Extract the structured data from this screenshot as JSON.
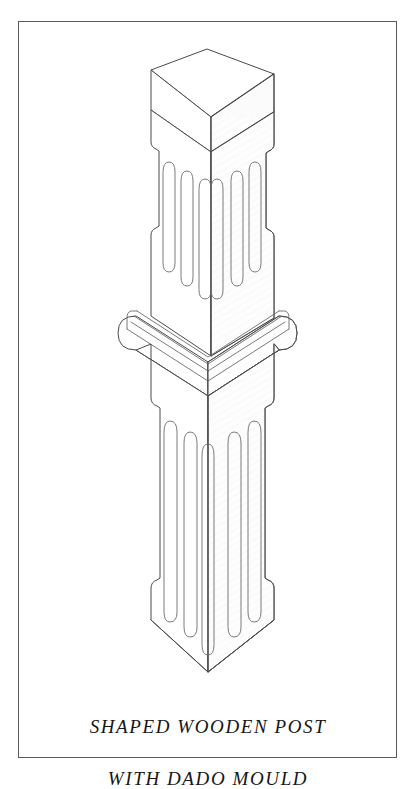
{
  "plate": {
    "frame": {
      "x": 18,
      "y": 21,
      "width": 379,
      "height": 737,
      "stroke": "#5a5a5a",
      "stroke_width": 1
    },
    "background_color": "#ffffff",
    "ink_color": "#4a4a4a"
  },
  "caption": {
    "line1": "SHAPED WOODEN POST",
    "line2": "WITH DADO MOULD",
    "style": "italic-serif-letterspaced",
    "color": "#161616",
    "align": "center"
  },
  "drawing": {
    "title": "shaped-wooden-post-isometric",
    "projection": "isometric",
    "stroke_color": "#4a4a4a",
    "stroke_width": 1,
    "face_fill_left": "#ffffff",
    "face_fill_right": "#fcfcfc",
    "face_fill_top": "#ffffff",
    "geometry": {
      "center_x": 207,
      "top_apex": {
        "x": 207,
        "y": 49
      },
      "top_left_corner": {
        "x": 151,
        "y": 70
      },
      "top_right_corner": {
        "x": 274,
        "y": 74
      },
      "top_front_corner": {
        "x": 211,
        "y": 117
      },
      "shaft_left_x": 151,
      "shaft_right_x": 274,
      "shaft_inset_left_x": 159,
      "shaft_inset_right_x": 266,
      "upper_shaft_top_y": 117,
      "upper_step_in_y": 146,
      "upper_step_out_y": 231,
      "mould_top_y": 309,
      "mould_bottom_y": 366,
      "mould_left_x": 118,
      "mould_right_x": 296,
      "lower_shaft_top_y": 366,
      "lower_step_in_y": 404,
      "lower_step_out_y": 592,
      "base_bottom_side_y": 620,
      "base_front_apex": {
        "x": 208,
        "y": 672
      }
    },
    "upper_flutes": {
      "count": 6,
      "per_face": 3,
      "description": "rounded-end vertical flutes, tops step lower toward centre edge"
    },
    "lower_flutes": {
      "count": 6,
      "per_face": 3,
      "description": "long rounded-end vertical flutes, tops step lower toward centre edge"
    },
    "dado_mould": {
      "profile": "bullnose band with three stepped fillet lines",
      "end_caps": "semicircular",
      "band_count": 3
    }
  }
}
